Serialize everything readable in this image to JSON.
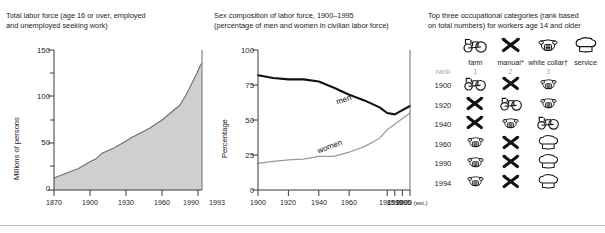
{
  "chart_data": [
    {
      "type": "area",
      "title": "Total labor force (age 16 or over, employed\nand unemployed seeking work)",
      "xlabel": "",
      "ylabel": "Millions of persons",
      "ylim": [
        0,
        150
      ],
      "yticks": [
        0,
        50,
        100,
        150
      ],
      "ytick_labels": [
        "0",
        "50",
        "100",
        "150"
      ],
      "yminor": [
        25,
        75,
        125
      ],
      "xlim": [
        1870,
        1993
      ],
      "xticks": [
        1870,
        1900,
        1930,
        1960,
        1990,
        1993
      ],
      "xtick_labels": [
        "1870",
        "1900",
        "1930",
        "1960",
        "1990",
        "1993"
      ],
      "grid": false,
      "legend": "none",
      "fill_color": "#cfcfcf",
      "line_color": "#6e6e6e",
      "x": [
        1870,
        1880,
        1890,
        1900,
        1905,
        1910,
        1920,
        1930,
        1935,
        1940,
        1950,
        1960,
        1965,
        1970,
        1975,
        1980,
        1985,
        1990,
        1993
      ],
      "values": [
        13,
        17,
        22,
        29,
        32,
        37,
        42,
        49,
        53,
        56,
        62,
        70,
        75,
        85,
        95,
        107,
        117,
        126,
        130
      ]
    },
    {
      "type": "line",
      "title": "Sex composition of labor force, 1900–1995\n(percentage of men and women in civilian labor force)",
      "xlabel": "",
      "ylabel": "Percentage",
      "ylim": [
        0,
        100
      ],
      "yticks": [
        0,
        25,
        50,
        75,
        100
      ],
      "ytick_labels": [
        "0",
        "25",
        "50",
        "75",
        "100"
      ],
      "xlim": [
        1900,
        2000
      ],
      "xticks": [
        1900,
        1920,
        1940,
        1960,
        1985,
        1990,
        1995,
        2000
      ],
      "xtick_labels": [
        "1900",
        "1920",
        "1940",
        "1960",
        "1985",
        "1990",
        "1995",
        "2000"
      ],
      "xtick_suffix_last": " (est.)",
      "grid": false,
      "legend": "inline",
      "series": [
        {
          "name": "men",
          "color": "#111111",
          "width": 2.1,
          "x": [
            1900,
            1910,
            1920,
            1930,
            1940,
            1950,
            1960,
            1970,
            1980,
            1985,
            1990,
            1995,
            2000
          ],
          "values": [
            82,
            80,
            79,
            79,
            77.5,
            73,
            68,
            64,
            59,
            55,
            54,
            57,
            60
          ]
        },
        {
          "name": "women",
          "color": "#9a9a9a",
          "width": 1.2,
          "x": [
            1900,
            1910,
            1920,
            1930,
            1940,
            1950,
            1960,
            1970,
            1980,
            1985,
            1990,
            1995,
            2000
          ],
          "values": [
            19,
            20.5,
            21.5,
            22,
            24,
            24,
            27,
            31,
            37,
            43,
            47,
            51,
            55
          ]
        }
      ]
    },
    {
      "type": "table",
      "title": "Top three occupational categories (rank based\non total numbers) for workers age 14 and older",
      "categories": [
        {
          "label": "farm",
          "icon": "tractor-icon"
        },
        {
          "label": "manual*",
          "icon": "crossed-tools-icon"
        },
        {
          "label": "white collar†",
          "icon": "telephone-icon"
        },
        {
          "label": "service",
          "icon": "chef-hat-icon"
        }
      ],
      "rank_label": "rank",
      "rank_values": [
        "1",
        "2",
        "3"
      ],
      "rows": [
        {
          "year": "1900",
          "icons": [
            "tractor-icon",
            "crossed-tools-icon",
            "telephone-icon"
          ]
        },
        {
          "year": "1920",
          "icons": [
            "crossed-tools-icon",
            "tractor-icon",
            "telephone-icon"
          ]
        },
        {
          "year": "1940",
          "icons": [
            "crossed-tools-icon",
            "telephone-icon",
            "tractor-icon"
          ]
        },
        {
          "year": "1960",
          "icons": [
            "telephone-icon",
            "crossed-tools-icon",
            "chef-hat-icon"
          ]
        },
        {
          "year": "1990",
          "icons": [
            "telephone-icon",
            "crossed-tools-icon",
            "chef-hat-icon"
          ]
        },
        {
          "year": "1994",
          "icons": [
            "telephone-icon",
            "crossed-tools-icon",
            "chef-hat-icon"
          ]
        }
      ]
    }
  ],
  "panels": {
    "left": {
      "title": "Total labor force (age 16 or over, employed\nand unemployed seeking work)"
    },
    "middle": {
      "title": "Sex composition of labor force, 1900–1995\n(percentage of men and women in civilian labor force)"
    },
    "right": {
      "title": "Top three occupational categories (rank based\non total numbers) for workers age 14 and older"
    }
  },
  "colors": {
    "area_fill": "#cfcfcf",
    "area_stroke": "#6e6e6e",
    "men_line": "#111111",
    "women_line": "#9a9a9a",
    "axis": "#3a3a3a",
    "rank_text": "#a8a8a8",
    "rule": "#b9b9b9"
  }
}
